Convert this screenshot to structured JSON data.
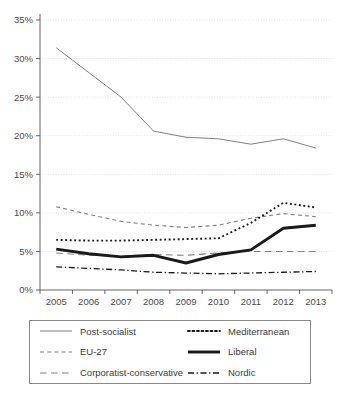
{
  "chart_data": {
    "type": "line",
    "title": "",
    "xlabel": "",
    "ylabel": "",
    "categories": [
      "2005",
      "2006",
      "2007",
      "2008",
      "2009",
      "2010",
      "2011",
      "2012",
      "2013"
    ],
    "x_tick_labels": [
      "2005",
      "2006",
      "2007",
      "2008",
      "2009",
      "2010",
      "2011",
      "2012",
      "2013"
    ],
    "y_tick_labels": [
      "0%",
      "5%",
      "10%",
      "15%",
      "20%",
      "25%",
      "30%",
      "35%"
    ],
    "y_tick_values": [
      0,
      5,
      10,
      15,
      20,
      25,
      30,
      35
    ],
    "ylim": [
      0,
      35
    ],
    "y_unit": "%",
    "grid": true,
    "legend_position": "bottom",
    "series": [
      {
        "name": "Post-socialist",
        "style": "solid-thin",
        "color": "#808080",
        "values": [
          31.4,
          28.2,
          25.0,
          20.6,
          19.8,
          19.6,
          18.9,
          19.6,
          18.4
        ]
      },
      {
        "name": "Mediterranean",
        "style": "dotted",
        "color": "#1a1a1a",
        "values": [
          6.5,
          6.4,
          6.4,
          6.5,
          6.6,
          6.7,
          8.7,
          11.3,
          10.7
        ]
      },
      {
        "name": "EU-27",
        "style": "short-dash",
        "color": "#808080",
        "values": [
          10.8,
          9.8,
          8.9,
          8.4,
          8.1,
          8.4,
          9.3,
          9.9,
          9.5
        ]
      },
      {
        "name": "Liberal",
        "style": "solid-thick",
        "color": "#1a1a1a",
        "values": [
          5.3,
          4.7,
          4.3,
          4.5,
          3.5,
          4.6,
          5.2,
          8.0,
          8.4
        ]
      },
      {
        "name": "Corporatist-conservative",
        "style": "long-dash",
        "color": "#808080",
        "values": [
          4.8,
          4.5,
          4.4,
          4.6,
          4.5,
          4.8,
          5.0,
          5.0,
          5.0
        ]
      },
      {
        "name": "Nordic",
        "style": "dash-dot",
        "color": "#1a1a1a",
        "values": [
          3.0,
          2.8,
          2.6,
          2.3,
          2.2,
          2.1,
          2.2,
          2.3,
          2.4
        ]
      }
    ]
  },
  "legend": {
    "items": [
      {
        "label": "Post-socialist",
        "style": "solid-thin",
        "color": "#808080"
      },
      {
        "label": "Mediterranean",
        "style": "dotted",
        "color": "#1a1a1a"
      },
      {
        "label": "EU-27",
        "style": "short-dash",
        "color": "#808080"
      },
      {
        "label": "Liberal",
        "style": "solid-thick",
        "color": "#1a1a1a"
      },
      {
        "label": "Corporatist-conservative",
        "style": "long-dash",
        "color": "#808080"
      },
      {
        "label": "Nordic",
        "style": "dash-dot",
        "color": "#1a1a1a"
      }
    ]
  },
  "colors": {
    "grid": "#d8d3cf",
    "axis": "#555555",
    "text": "#3b3b3b",
    "series_gray": "#808080",
    "series_black": "#1a1a1a",
    "background": "#ffffff"
  }
}
